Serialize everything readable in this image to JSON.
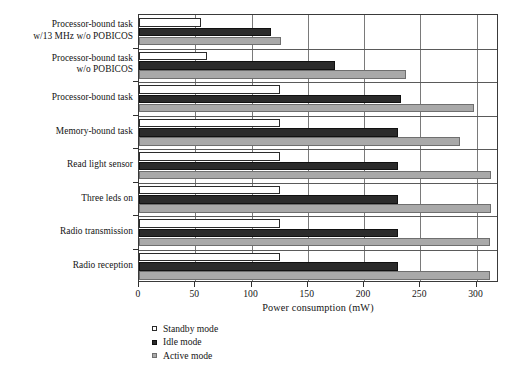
{
  "chart_data": {
    "type": "bar",
    "orientation": "horizontal",
    "title": "",
    "xlabel": "Power consumption (mW)",
    "ylabel": "",
    "xlim": [
      0,
      320
    ],
    "xticks": [
      0,
      50,
      100,
      150,
      200,
      250,
      300
    ],
    "xticklabels": [
      "0",
      "50",
      "100",
      "150",
      "200",
      "250",
      "300"
    ],
    "grid": "vertical",
    "legend_position": "below-left",
    "categories": [
      "Processor-bound task\nw/13 MHz w/o POBICOS",
      "Processor-bound task\nw/o POBICOS",
      "Processor-bound task",
      "Memory-bound task",
      "Read light sensor",
      "Three leds on",
      "Radio transmission",
      "Radio reception"
    ],
    "category_lines": [
      [
        "Processor-bound task",
        "w/13 MHz w/o POBICOS"
      ],
      [
        "Processor-bound task",
        "w/o POBICOS"
      ],
      [
        "Processor-bound task"
      ],
      [
        "Memory-bound task"
      ],
      [
        "Read light sensor"
      ],
      [
        "Three leds on"
      ],
      [
        "Radio transmission"
      ],
      [
        "Radio reception"
      ]
    ],
    "series": [
      {
        "name": "Standby mode",
        "color": "#ffffff",
        "edge_color": "#2b2b2b",
        "values": [
          55,
          60,
          125,
          125,
          125,
          125,
          125,
          125
        ]
      },
      {
        "name": "Idle mode",
        "color": "#2b2b2b",
        "edge_color": "#111111",
        "values": [
          117,
          174,
          233,
          230,
          230,
          230,
          230,
          230
        ]
      },
      {
        "name": "Active mode",
        "color": "#a9a9a9",
        "edge_color": "#6f6f6f",
        "values": [
          126,
          237,
          298,
          285,
          313,
          313,
          312,
          312
        ]
      }
    ]
  },
  "legend": {
    "items": [
      {
        "label": "Standby mode",
        "marker": "open-square-marker"
      },
      {
        "label": "Idle mode",
        "marker": "filled-dark-square-marker"
      },
      {
        "label": "Active mode",
        "marker": "filled-gray-square-marker"
      }
    ]
  }
}
